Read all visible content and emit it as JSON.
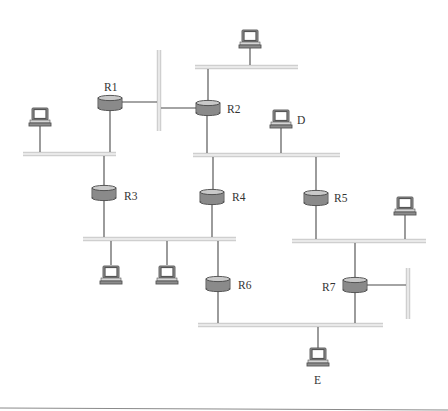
{
  "diagram": {
    "colors": {
      "router_body": "#8a8a8a",
      "router_top": "#c9c9c9",
      "lan_bar": "#cfcfcf",
      "link": "#4a4a4a",
      "label": "#333333"
    },
    "routers": [
      {
        "id": "R1",
        "label": "R1"
      },
      {
        "id": "R2",
        "label": "R2"
      },
      {
        "id": "R3",
        "label": "R3"
      },
      {
        "id": "R4",
        "label": "R4"
      },
      {
        "id": "R5",
        "label": "R5"
      },
      {
        "id": "R6",
        "label": "R6"
      },
      {
        "id": "R7",
        "label": "R7"
      }
    ],
    "hosts": [
      {
        "id": "host-top",
        "label": ""
      },
      {
        "id": "host-left",
        "label": ""
      },
      {
        "id": "host-d",
        "label": "D"
      },
      {
        "id": "host-right",
        "label": ""
      },
      {
        "id": "host-lower-1",
        "label": ""
      },
      {
        "id": "host-lower-2",
        "label": ""
      },
      {
        "id": "host-e",
        "label": "E"
      }
    ],
    "networks": [
      {
        "id": "lan-top",
        "connects": [
          "R2",
          "host-top"
        ]
      },
      {
        "id": "lan-r1-r2-vertical",
        "connects": [
          "R1",
          "R2"
        ]
      },
      {
        "id": "lan-left",
        "connects": [
          "R1",
          "R3",
          "host-left"
        ]
      },
      {
        "id": "lan-middle",
        "connects": [
          "R2",
          "R4",
          "R5",
          "host-d"
        ]
      },
      {
        "id": "lan-lower-left",
        "connects": [
          "R3",
          "R4",
          "R6",
          "host-lower-1",
          "host-lower-2"
        ]
      },
      {
        "id": "lan-right",
        "connects": [
          "R5",
          "R7",
          "host-right"
        ]
      },
      {
        "id": "lan-r7-vertical",
        "connects": [
          "R7"
        ]
      },
      {
        "id": "lan-bottom",
        "connects": [
          "R6",
          "R7",
          "host-e"
        ]
      }
    ]
  }
}
